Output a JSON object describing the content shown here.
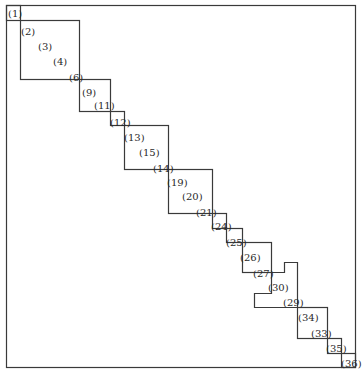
{
  "diagram": {
    "type": "block-diagonal matrix structure (hand drawn)",
    "line_color": "#3a3a3a",
    "labels": [
      {
        "text": "(1)",
        "x": 8,
        "y": 9
      },
      {
        "text": "(2)",
        "x": 21,
        "y": 27
      },
      {
        "text": "(3)",
        "x": 38,
        "y": 42
      },
      {
        "text": "(4)",
        "x": 53,
        "y": 57
      },
      {
        "text": "(6)",
        "x": 69,
        "y": 73
      },
      {
        "text": "(9)",
        "x": 82,
        "y": 88
      },
      {
        "text": "(11)",
        "x": 94,
        "y": 101
      },
      {
        "text": "(12)",
        "x": 110,
        "y": 118
      },
      {
        "text": "(13)",
        "x": 124,
        "y": 133
      },
      {
        "text": "(15)",
        "x": 139,
        "y": 148
      },
      {
        "text": "(14)",
        "x": 153,
        "y": 164
      },
      {
        "text": "(19)",
        "x": 167,
        "y": 178
      },
      {
        "text": "(20)",
        "x": 182,
        "y": 192
      },
      {
        "text": "(21)",
        "x": 196,
        "y": 208
      },
      {
        "text": "(24)",
        "x": 211,
        "y": 222
      },
      {
        "text": "(25)",
        "x": 226,
        "y": 238
      },
      {
        "text": "(26)",
        "x": 240,
        "y": 253
      },
      {
        "text": "(27)",
        "x": 253,
        "y": 269
      },
      {
        "text": "(30)",
        "x": 268,
        "y": 283
      },
      {
        "text": "(29)",
        "x": 283,
        "y": 298
      },
      {
        "text": "(34)",
        "x": 298,
        "y": 313
      },
      {
        "text": "(33)",
        "x": 311,
        "y": 329
      },
      {
        "text": "(35)",
        "x": 326,
        "y": 344
      },
      {
        "text": "(36)",
        "x": 341,
        "y": 359
      }
    ]
  }
}
